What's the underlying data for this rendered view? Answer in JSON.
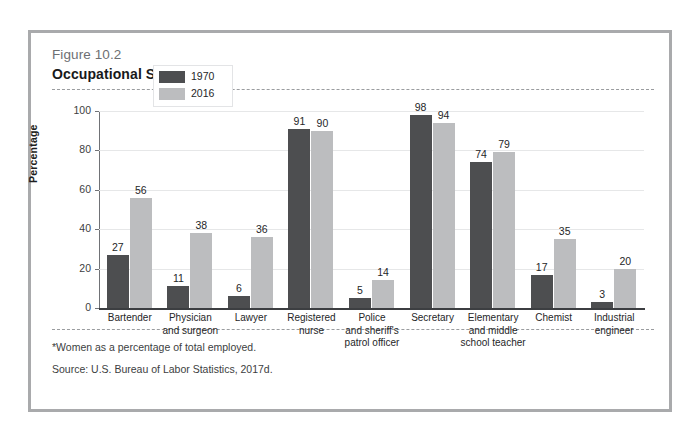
{
  "figure": {
    "number": "Figure 10.2",
    "title": "Occupational Segregation",
    "footnote": "*Women as a percentage of total employed.",
    "source": "Source: U.S. Bureau of Labor Statistics, 2017d."
  },
  "legend": {
    "items": [
      {
        "label": "1970",
        "color": "#4d4e50"
      },
      {
        "label": "2016",
        "color": "#bcbdbf"
      }
    ]
  },
  "axis": {
    "ylabel": "Percentage",
    "yticks": [
      "0",
      "20",
      "40",
      "60",
      "80",
      "100"
    ]
  },
  "chart_data": {
    "type": "bar",
    "title": "Occupational Segregation",
    "xlabel": "",
    "ylabel": "Percentage",
    "ylim": [
      0,
      100
    ],
    "ytick_values": [
      0,
      20,
      40,
      60,
      80,
      100
    ],
    "grid": true,
    "legend_position": "top-left-inside",
    "categories": [
      "Bartender",
      "Physician and surgeon",
      "Lawyer",
      "Registered nurse",
      "Police and sheriff's patrol officer",
      "Secretary",
      "Elementary and middle school teacher",
      "Chemist",
      "Industrial engineer"
    ],
    "category_lines": [
      [
        "Bartender"
      ],
      [
        "Physician",
        "and surgeon"
      ],
      [
        "Lawyer"
      ],
      [
        "Registered",
        "nurse"
      ],
      [
        "Police",
        "and sheriff's",
        "patrol officer"
      ],
      [
        "Secretary"
      ],
      [
        "Elementary",
        "and middle",
        "school teacher"
      ],
      [
        "Chemist"
      ],
      [
        "Industrial",
        "engineer"
      ]
    ],
    "series": [
      {
        "name": "1970",
        "color": "#4d4e50",
        "values": [
          27,
          11,
          6,
          91,
          5,
          98,
          74,
          17,
          3
        ]
      },
      {
        "name": "2016",
        "color": "#bcbdbf",
        "values": [
          56,
          38,
          36,
          90,
          14,
          94,
          79,
          35,
          20
        ]
      }
    ],
    "annotation": "*Women as a percentage of total employed.",
    "source": "Source: U.S. Bureau of Labor Statistics, 2017d."
  }
}
